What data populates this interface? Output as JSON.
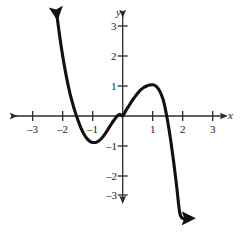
{
  "figure": {
    "width": 243,
    "height": 234,
    "background": "#ffffff",
    "axis_color": "#2b2b2b",
    "curve_color": "#111111",
    "label_color": "#1a1a1a",
    "x_axis_label": "x",
    "y_axis_label": "y"
  },
  "chart_data": {
    "type": "line",
    "title": "",
    "xlabel": "x",
    "ylabel": "y",
    "grid": false,
    "legend": "none",
    "xlim": [
      -3.7,
      3.8
    ],
    "ylim": [
      -3.9,
      3.55
    ],
    "xticks": [
      -3,
      -2,
      -1,
      1,
      2,
      3
    ],
    "yticks": [
      3,
      2,
      1,
      -1,
      -2,
      -3
    ],
    "xtick_labels": [
      "–3",
      "–2",
      "–1",
      "1",
      "2",
      "3"
    ],
    "ytick_labels": [
      "3",
      "2",
      "1",
      "–1",
      "–2",
      "–3"
    ],
    "series": [
      {
        "name": "cubic",
        "arrow_start": true,
        "arrow_end": true,
        "x": [
          -2.2,
          -2.1,
          -2.0,
          -1.9,
          -1.8,
          -1.75,
          -1.7,
          -1.6,
          -1.5,
          -1.4,
          -1.3,
          -1.2,
          -1.1,
          -1.0,
          -0.9,
          -0.8,
          -0.7,
          -0.6,
          -0.5,
          -0.4,
          -0.3,
          -0.2,
          -0.1,
          0.0,
          0.1,
          0.2,
          0.3,
          0.4,
          0.5,
          0.6,
          0.7,
          0.8,
          0.9,
          1.0,
          1.1,
          1.2,
          1.3,
          1.38,
          1.5,
          1.6,
          1.7,
          1.8,
          1.9,
          2.0,
          2.1,
          2.2
        ],
        "y": [
          3.41,
          2.66,
          2.0,
          1.43,
          0.94,
          0.72,
          0.53,
          0.18,
          -0.12,
          -0.38,
          -0.59,
          -0.74,
          -0.84,
          -0.88,
          -0.88,
          -0.83,
          -0.74,
          -0.61,
          -0.46,
          -0.3,
          -0.15,
          -0.02,
          0.06,
          0.0,
          0.17,
          0.33,
          0.49,
          0.63,
          0.76,
          0.87,
          0.95,
          1.0,
          1.03,
          1.04,
          1.0,
          0.89,
          0.68,
          0.43,
          -0.18,
          -0.81,
          -1.54,
          -2.35,
          -3.22,
          -3.41,
          -3.41,
          -3.41
        ],
        "roots": [
          -1.75,
          0,
          1.38
        ],
        "local_min": {
          "x": -1.0,
          "y": -0.88
        },
        "local_max": {
          "x": 1.0,
          "y": 1.04
        }
      }
    ]
  }
}
